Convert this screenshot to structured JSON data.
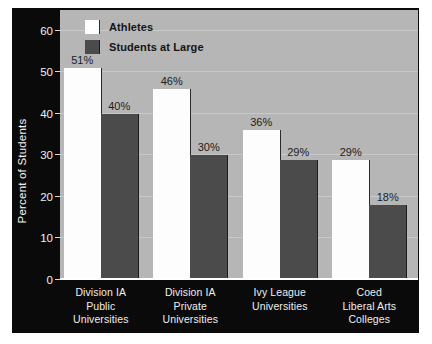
{
  "chart_data": {
    "type": "bar",
    "title": "",
    "xlabel": "",
    "ylabel": "Percent of Students",
    "ylim": [
      0,
      65
    ],
    "yticks": [
      0,
      10,
      20,
      30,
      40,
      50,
      60
    ],
    "ytick_labels": [
      "0",
      "10",
      "20",
      "30",
      "40",
      "50",
      "60"
    ],
    "grid": true,
    "legend_position": "top-left",
    "categories": [
      "Division IA\nPublic\nUniversities",
      "Division IA\nPrivate\nUniversities",
      "Ivy League\nUniversities",
      "Coed\nLiberal Arts\nColleges"
    ],
    "category_lines": [
      [
        "Division IA",
        "Public",
        "Universities"
      ],
      [
        "Division IA",
        "Private",
        "Universities"
      ],
      [
        "Ivy League",
        "Universities"
      ],
      [
        "Coed",
        "Liberal Arts",
        "Colleges"
      ]
    ],
    "series": [
      {
        "name": "Athletes",
        "color": "#ffffff",
        "values": [
          51,
          46,
          36,
          29
        ],
        "labels": [
          "51%",
          "46%",
          "36%",
          "29%"
        ]
      },
      {
        "name": "Students at Large",
        "color": "#4b4b4b",
        "values": [
          40,
          30,
          29,
          18
        ],
        "labels": [
          "40%",
          "30%",
          "29%",
          "18%"
        ]
      }
    ]
  },
  "legend": {
    "items": [
      {
        "label": "Athletes",
        "swatch": "white"
      },
      {
        "label": "Students at Large",
        "swatch": "dark"
      }
    ]
  },
  "colors": {
    "panel_background": "#0a0a0a",
    "plot_background": "#b6b6b6",
    "gridline": "#c9c9c9",
    "axis_text": "#f0f0f0",
    "value_text": "#1c1c1c",
    "bar_athletes": "#ffffff",
    "bar_students_at_large": "#4b4b4b"
  }
}
